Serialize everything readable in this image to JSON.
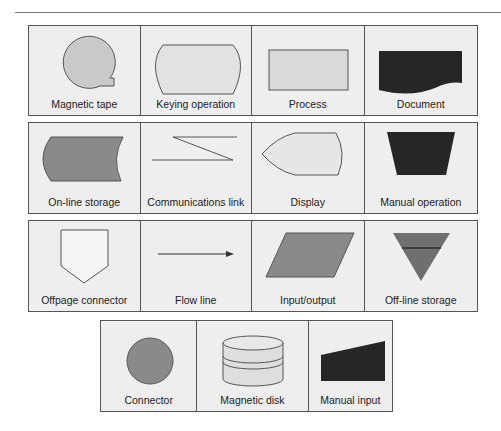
{
  "colors": {
    "light_fill": "#d9d9d9",
    "medium_fill": "#8a8a8a",
    "dark_fill": "#262626",
    "stroke": "#555555",
    "cell_bg": "#eeeeee"
  },
  "rows": [
    {
      "cells": [
        {
          "label": "Magnetic tape",
          "shape": "magnetic-tape"
        },
        {
          "label": "Keying operation",
          "shape": "keying-operation"
        },
        {
          "label": "Process",
          "shape": "process"
        },
        {
          "label": "Document",
          "shape": "document"
        }
      ]
    },
    {
      "cells": [
        {
          "label": "On-line storage",
          "shape": "online-storage"
        },
        {
          "label": "Communications link",
          "shape": "communications-link"
        },
        {
          "label": "Display",
          "shape": "display"
        },
        {
          "label": "Manual operation",
          "shape": "manual-operation"
        }
      ]
    },
    {
      "cells": [
        {
          "label": "Offpage connector",
          "shape": "offpage-connector"
        },
        {
          "label": "Flow line",
          "shape": "flow-line"
        },
        {
          "label": "Input/output",
          "shape": "input-output"
        },
        {
          "label": "Off-line storage",
          "shape": "offline-storage"
        }
      ]
    },
    {
      "cells": [
        {
          "label": "Connector",
          "shape": "connector"
        },
        {
          "label": "Magnetic disk",
          "shape": "magnetic-disk"
        },
        {
          "label": "Manual input",
          "shape": "manual-input"
        }
      ]
    }
  ]
}
